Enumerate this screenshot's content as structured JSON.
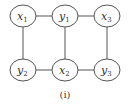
{
  "diagram": {
    "caption": "(i)",
    "nodes": [
      {
        "id": "x1",
        "base": "x",
        "sub": "1",
        "cx": 23,
        "cy": 16
      },
      {
        "id": "y1",
        "base": "y",
        "sub": "1",
        "cx": 65,
        "cy": 16
      },
      {
        "id": "x3",
        "base": "x",
        "sub": "3",
        "cx": 107,
        "cy": 16
      },
      {
        "id": "y2",
        "base": "y",
        "sub": "2",
        "cx": 23,
        "cy": 70
      },
      {
        "id": "x2",
        "base": "x",
        "sub": "2",
        "cx": 65,
        "cy": 70
      },
      {
        "id": "y3",
        "base": "y",
        "sub": "3",
        "cx": 107,
        "cy": 70
      }
    ],
    "edges": [
      [
        "x1",
        "y1"
      ],
      [
        "y1",
        "x3"
      ],
      [
        "y2",
        "x2"
      ],
      [
        "x2",
        "y3"
      ],
      [
        "x1",
        "y2"
      ],
      [
        "y1",
        "x2"
      ],
      [
        "x3",
        "y3"
      ]
    ],
    "colors": {
      "stroke": "#555555",
      "fill": "#ffffff"
    }
  }
}
